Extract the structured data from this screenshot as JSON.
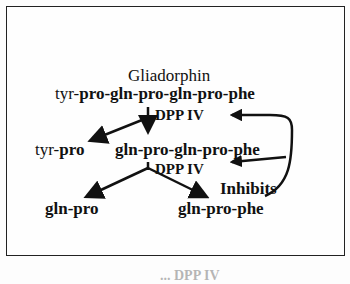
{
  "diagram": {
    "title": "Gliadorphin",
    "peptide": {
      "plain": "tyr-",
      "bold": "pro-gln-pro-gln-pro-phe"
    },
    "enzyme1": "DPP IV",
    "left_product": {
      "plain": "tyr-",
      "bold": "pro"
    },
    "middle_product": "gln-pro-gln-pro-phe",
    "enzyme2": "DPP IV",
    "inhibits_label": "Inhibits",
    "final_left": "gln-pro",
    "final_right": "gln-pro-phe"
  },
  "caption": "... DPP IV"
}
